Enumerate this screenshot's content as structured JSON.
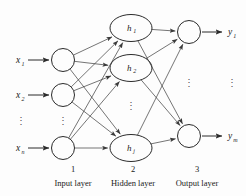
{
  "figure": {
    "background_color": "#fdfdfd",
    "stroke_color": "#2b2b2b",
    "edge_color": "#3a3a3a"
  },
  "layers": [
    {
      "index": "1",
      "number_label": "1",
      "name_label": "Input layer",
      "label_x": 73,
      "number_y": 172,
      "name_y": 186,
      "node_shape": "circle",
      "nodes": [
        {
          "id": "in1",
          "cx": 63,
          "cy": 60,
          "r": 11.5,
          "label": "",
          "sub": ""
        },
        {
          "id": "in2",
          "cx": 63,
          "cy": 95,
          "r": 11.5,
          "label": "",
          "sub": ""
        },
        {
          "id": "in3",
          "cx": 63,
          "cy": 148,
          "r": 11.5,
          "label": "",
          "sub": ""
        }
      ],
      "ellipsis": {
        "x": 63,
        "y": 124,
        "glyph": "⋮"
      }
    },
    {
      "index": "2",
      "number_label": "2",
      "name_label": "Hidden layer",
      "label_x": 133,
      "number_y": 172,
      "name_y": 186,
      "node_shape": "ellipse",
      "nodes": [
        {
          "id": "h1",
          "cx": 131,
          "cy": 28,
          "rx": 21,
          "ry": 13.5,
          "label": "h",
          "sub": "1"
        },
        {
          "id": "h2",
          "cx": 131,
          "cy": 68,
          "rx": 21,
          "ry": 13.5,
          "label": "h",
          "sub": "2"
        },
        {
          "id": "hj",
          "cx": 131,
          "cy": 148,
          "rx": 21,
          "ry": 13.5,
          "label": "h",
          "sub": "j"
        }
      ],
      "ellipsis": {
        "x": 131,
        "y": 109,
        "glyph": "⋮"
      }
    },
    {
      "index": "3",
      "number_label": "3",
      "name_label": "Output layer",
      "label_x": 197,
      "number_y": 172,
      "name_y": 186,
      "node_shape": "circle",
      "nodes": [
        {
          "id": "out1",
          "cx": 189,
          "cy": 32,
          "r": 11.5,
          "label": "",
          "sub": ""
        },
        {
          "id": "out2",
          "cx": 189,
          "cy": 136,
          "r": 11.5,
          "label": "",
          "sub": ""
        }
      ],
      "ellipsis": {
        "x": 189,
        "y": 86,
        "glyph": "⋮"
      }
    }
  ],
  "inputs": {
    "labels": [
      {
        "base": "x",
        "sub": "1",
        "tx": 16,
        "ty": 63,
        "arrow_x1": 28,
        "arrow_x2": 49,
        "arrow_y": 60
      },
      {
        "base": "x",
        "sub": "2",
        "tx": 16,
        "ty": 98,
        "arrow_x1": 28,
        "arrow_x2": 49,
        "arrow_y": 95
      },
      {
        "base": "x",
        "sub": "n",
        "tx": 16,
        "ty": 151,
        "arrow_x1": 28,
        "arrow_x2": 49,
        "arrow_y": 148
      }
    ],
    "ellipsis": {
      "x": 21,
      "y": 124,
      "glyph": "⋮"
    }
  },
  "outputs": {
    "labels": [
      {
        "base": "y",
        "sub": "1",
        "tx": 228,
        "ty": 35,
        "arrow_x1": 202,
        "arrow_x2": 222,
        "arrow_y": 32
      },
      {
        "base": "y",
        "sub": "m",
        "tx": 228,
        "ty": 139,
        "arrow_x1": 202,
        "arrow_x2": 222,
        "arrow_y": 136
      }
    ],
    "ellipsis": {
      "x": 232,
      "y": 86,
      "glyph": "⋮"
    }
  },
  "connections": {
    "input_to_hidden": [
      {
        "from": "in1",
        "to": "h1"
      },
      {
        "from": "in1",
        "to": "h2"
      },
      {
        "from": "in1",
        "to": "hj"
      },
      {
        "from": "in2",
        "to": "h1"
      },
      {
        "from": "in2",
        "to": "h2"
      },
      {
        "from": "in2",
        "to": "hj"
      },
      {
        "from": "in3",
        "to": "h1"
      },
      {
        "from": "in3",
        "to": "h2"
      },
      {
        "from": "in3",
        "to": "hj"
      }
    ],
    "hidden_to_output": [
      {
        "from": "h1",
        "to": "out1"
      },
      {
        "from": "h1",
        "to": "out2"
      },
      {
        "from": "h2",
        "to": "out1"
      },
      {
        "from": "h2",
        "to": "out2"
      },
      {
        "from": "hj",
        "to": "out1"
      },
      {
        "from": "hj",
        "to": "out2"
      }
    ]
  }
}
